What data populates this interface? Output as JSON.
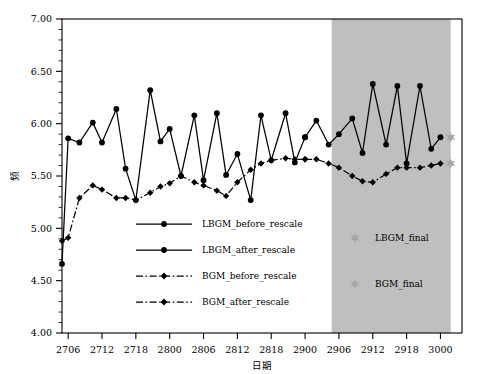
{
  "chart_data": {
    "type": "line",
    "title": "",
    "xlabel": "日期",
    "ylabel": "频",
    "xlim": [
      0,
      39
    ],
    "ylim": [
      4.0,
      7.0
    ],
    "ytick_labels": [
      "4.00",
      "4.50",
      "5.00",
      "5.50",
      "6.00",
      "6.50",
      "7.00"
    ],
    "ytick_values": [
      4.0,
      4.5,
      5.0,
      5.5,
      6.0,
      6.5,
      7.0
    ],
    "xtick_labels": [
      "2706",
      "2712",
      "2718",
      "2800",
      "2806",
      "2812",
      "2818",
      "2900",
      "2906",
      "2912",
      "2918",
      "3000"
    ],
    "xtick_values": [
      0.6,
      3.9,
      7.2,
      10.5,
      13.8,
      17.1,
      20.4,
      23.7,
      27.0,
      30.3,
      33.6,
      36.9
    ],
    "grid": false,
    "legend_position": "center-left",
    "shaded_region": {
      "name": "forecast-region",
      "x_start": 26.3,
      "x_end": 37.9,
      "color": "#bfbfbf"
    },
    "series": [
      {
        "name": "LBGM_before_rescale",
        "style": "solid",
        "color": "#000000",
        "marker": "circle",
        "x": [
          0.0,
          0.6,
          1.7,
          3.0,
          3.9,
          5.3,
          6.2,
          7.2,
          8.6,
          9.6,
          10.5,
          11.6,
          12.9,
          13.8,
          15.1,
          16.0,
          17.1,
          18.4,
          19.4,
          20.4,
          21.8,
          22.7,
          23.7
        ],
        "y": [
          4.66,
          5.86,
          5.82,
          6.01,
          5.82,
          6.14,
          5.57,
          5.27,
          6.32,
          5.83,
          5.95,
          5.5,
          6.08,
          5.46,
          6.1,
          5.51,
          5.71,
          5.27,
          6.08,
          5.65,
          6.1,
          5.63,
          5.87
        ]
      },
      {
        "name": "LBGM_after_rescale",
        "style": "solid",
        "color": "#000000",
        "marker": "circle",
        "x": [
          23.7,
          24.8,
          26.0,
          27.0,
          28.3,
          29.3,
          30.3,
          31.6,
          32.7,
          33.6,
          34.9,
          36.0,
          36.9
        ],
        "y": [
          5.87,
          6.03,
          5.8,
          5.9,
          6.05,
          5.72,
          6.38,
          5.8,
          6.36,
          5.62,
          6.36,
          5.76,
          5.87
        ]
      },
      {
        "name": "BGM_before_rescale",
        "style": "dashdot",
        "color": "#000000",
        "marker": "diamond",
        "x": [
          0.0,
          0.6,
          1.7,
          3.0,
          3.9,
          5.3,
          6.2,
          7.2,
          8.6,
          9.6,
          10.5,
          11.6,
          12.9,
          13.8,
          15.1,
          16.0,
          17.1,
          18.4,
          19.4,
          20.4,
          21.8,
          22.7,
          23.7
        ],
        "y": [
          4.88,
          4.91,
          5.29,
          5.41,
          5.37,
          5.29,
          5.29,
          5.27,
          5.34,
          5.4,
          5.43,
          5.5,
          5.44,
          5.41,
          5.36,
          5.31,
          5.44,
          5.56,
          5.62,
          5.65,
          5.67,
          5.66,
          5.66
        ]
      },
      {
        "name": "BGM_after_rescale",
        "style": "dashdot",
        "color": "#000000",
        "marker": "diamond",
        "x": [
          23.7,
          24.8,
          26.0,
          27.0,
          28.3,
          29.3,
          30.3,
          31.6,
          32.7,
          33.6,
          34.9,
          36.0,
          36.9
        ],
        "y": [
          5.66,
          5.66,
          5.62,
          5.58,
          5.5,
          5.45,
          5.44,
          5.52,
          5.58,
          5.58,
          5.58,
          5.6,
          5.62
        ]
      }
    ],
    "point_markers": [
      {
        "name": "LBGM_final",
        "x": 37.9,
        "y": 5.87,
        "color": "#a6a6a6",
        "marker": "star"
      },
      {
        "name": "BGM_final",
        "x": 37.9,
        "y": 5.62,
        "color": "#a6a6a6",
        "marker": "star"
      }
    ],
    "legend_left": [
      {
        "label": "LBGM_before_rescale",
        "style": "solid",
        "marker": "circle"
      },
      {
        "label": "LBGM_after_rescale",
        "style": "solid",
        "marker": "circle"
      },
      {
        "label": "BGM_before_rescale",
        "style": "dashdot",
        "marker": "diamond"
      },
      {
        "label": "BGM_after_rescale",
        "style": "dashdot",
        "marker": "diamond"
      }
    ],
    "legend_right": [
      {
        "label": "LBGM_final",
        "marker": "star",
        "color": "#a6a6a6"
      },
      {
        "label": "BGM_final",
        "marker": "star",
        "color": "#a6a6a6"
      }
    ]
  },
  "ghost_header": ""
}
